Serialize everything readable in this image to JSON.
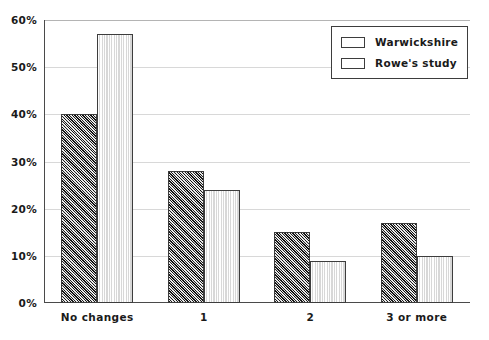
{
  "chart_data": {
    "type": "bar",
    "title": "",
    "xlabel": "",
    "ylabel": "",
    "categories": [
      "No changes",
      "1",
      "2",
      "3 or more"
    ],
    "series": [
      {
        "name": "Warwickshire",
        "values": [
          40,
          28,
          15,
          17
        ],
        "color": "#8f8f8f",
        "pattern": "crosshatch"
      },
      {
        "name": "Rowe's study",
        "values": [
          57,
          24,
          9,
          10
        ],
        "color": "#e4e4e4",
        "pattern": "light-vertical"
      }
    ],
    "ylim": [
      0,
      60
    ],
    "yticks": [
      0,
      10,
      20,
      30,
      40,
      50,
      60
    ],
    "ytick_labels": [
      "0%",
      "10%",
      "20%",
      "30%",
      "40%",
      "50%",
      "60%"
    ],
    "grid": true,
    "legend_position": "top-right"
  }
}
